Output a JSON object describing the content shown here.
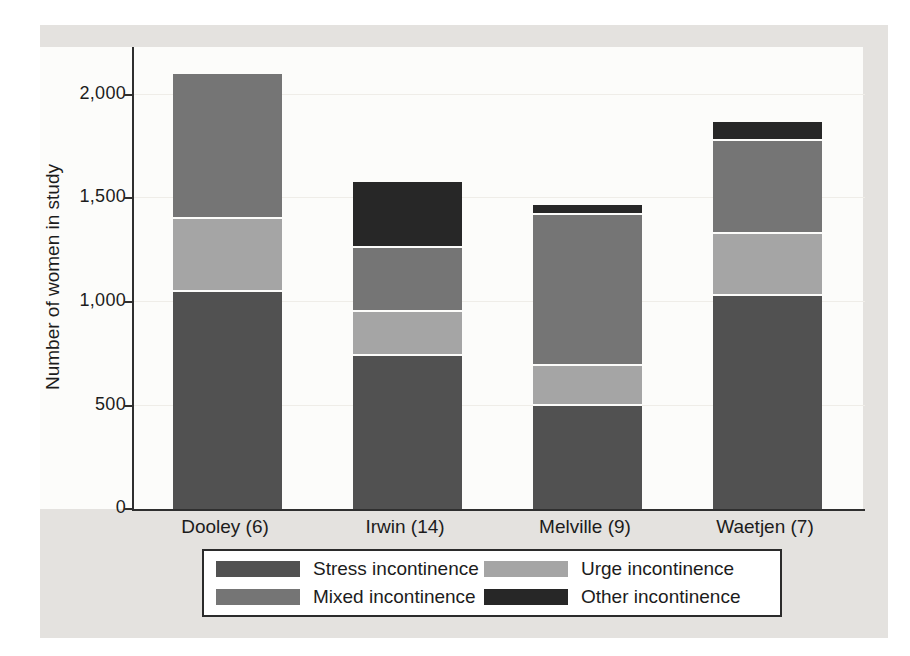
{
  "figure": {
    "y_axis_title": "Number of women in study",
    "x_axis_labels": [
      "Dooley (6)",
      "Irwin (14)",
      "Melville (9)",
      "Waetjen (7)"
    ],
    "colors": {
      "panel_background": "#e4e2df",
      "plot_background": "#fcfcfa",
      "axis": "#2f2f2f",
      "gridline": "#efede8",
      "legend_border": "#2b2b2b"
    }
  },
  "chart_data": {
    "type": "bar",
    "stacked": true,
    "title": "",
    "xlabel": "",
    "ylabel": "Number of women in study",
    "categories": [
      "Dooley (6)",
      "Irwin (14)",
      "Melville (9)",
      "Waetjen (7)"
    ],
    "series": [
      {
        "name": "Stress incontinence",
        "color": "#515151",
        "values": [
          1050,
          740,
          500,
          1030
        ]
      },
      {
        "name": "Urge incontinence",
        "color": "#a5a5a5",
        "values": [
          350,
          210,
          190,
          300
        ]
      },
      {
        "name": "Mixed incontinence",
        "color": "#757575",
        "values": [
          700,
          310,
          730,
          450
        ]
      },
      {
        "name": "Other incontinence",
        "color": "#272727",
        "values": [
          0,
          320,
          50,
          90
        ]
      }
    ],
    "stack_totals": [
      2100,
      1580,
      1470,
      1870
    ],
    "stack_order_bottom_to_top": [
      "Stress incontinence",
      "Urge incontinence",
      "Mixed incontinence",
      "Other incontinence"
    ],
    "ylim": [
      0,
      2222
    ],
    "yticks": [
      0,
      500,
      1000,
      1500,
      2000
    ],
    "ytick_labels": [
      "0",
      "500",
      "1,000",
      "1,500",
      "2,000"
    ],
    "grid": true,
    "legend_position": "bottom-center"
  }
}
